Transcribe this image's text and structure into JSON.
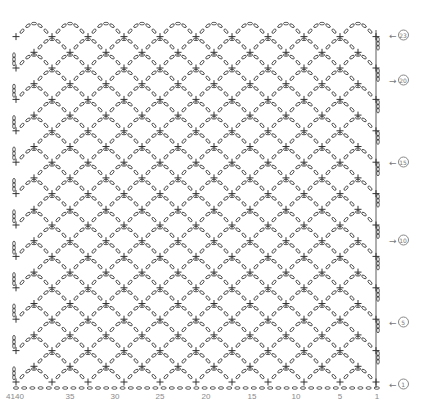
{
  "diagram": {
    "rows": 23,
    "row_spacing": 15.7,
    "first_row_y": 382,
    "left_x": 16,
    "right_x": 376,
    "repeat_width": 36,
    "foundation_y": 388,
    "line_color": "#333333",
    "stitch_numbers": [
      {
        "label": "4140",
        "x": 15
      },
      {
        "label": "35",
        "x": 70
      },
      {
        "label": "30",
        "x": 115
      },
      {
        "label": "25",
        "x": 160
      },
      {
        "label": "20",
        "x": 206
      },
      {
        "label": "15",
        "x": 252
      },
      {
        "label": "10",
        "x": 296
      },
      {
        "label": "5",
        "x": 340
      },
      {
        "label": "1",
        "x": 377
      }
    ],
    "row_labels": [
      {
        "row": "23",
        "arrow": "←",
        "y": 35
      },
      {
        "row": "20",
        "arrow": "→",
        "y": 80
      },
      {
        "row": "15",
        "arrow": "←",
        "y": 162
      },
      {
        "row": "10",
        "arrow": "→",
        "y": 240
      },
      {
        "row": "5",
        "arrow": "←",
        "y": 322
      },
      {
        "row": "1",
        "arrow": "←",
        "y": 384
      }
    ],
    "legend_symbols": {
      "single_crochet": "+",
      "chain": "oval",
      "turning_chain": "vertical-ovals"
    }
  }
}
